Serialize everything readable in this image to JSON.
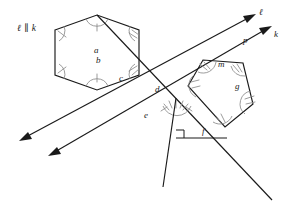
{
  "figure": {
    "background_color": "#ffffff",
    "stroke_color": "#1a1a1a",
    "arc_color": "#8a8a8a",
    "width": 283,
    "height": 205
  },
  "annotations": {
    "parallel_statement": "ℓ ∥ k",
    "ray_label_l": "ℓ",
    "ray_label_k": "k",
    "angle_a": "a",
    "angle_b": "b",
    "angle_c": "c",
    "angle_d": "d",
    "angle_e": "e",
    "angle_f": "f",
    "angle_g": "g",
    "angle_m": "m",
    "point_p": "p"
  },
  "geometry": {
    "hexagon_points": "55,30 97,15 139,30 139,75 97,90 55,75",
    "pentagon_points": "188,86 203,60 243,63 253,104 225,127",
    "triangle_points": "163,187 176,114 227,127",
    "ray_l": {
      "x1": 21,
      "y1": 140,
      "x2": 255,
      "y2": 14
    },
    "ray_k": {
      "x1": 50,
      "y1": 155,
      "x2": 272,
      "y2": 26
    },
    "transversal": {
      "x1": 97,
      "y1": 15,
      "x2": 272,
      "y2": 200
    },
    "vertical_segment": {
      "x1": 176,
      "y1": 98,
      "x2": 163,
      "y2": 187
    },
    "horizontal_segment": {
      "x1": 176,
      "y1": 138,
      "x2": 227,
      "y2": 138
    },
    "right_angle_vertex": "176,138"
  }
}
